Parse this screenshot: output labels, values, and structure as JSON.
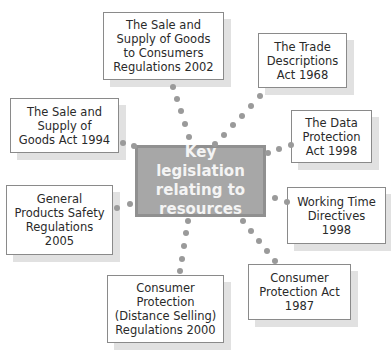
{
  "diagram": {
    "center": {
      "label": "Key legislation\nrelating to\nresources"
    },
    "nodes": [
      {
        "id": "sale-supply-consumers-2002",
        "label": "The Sale and\nSupply of Goods\nto Consumers\nRegulations 2002"
      },
      {
        "id": "trade-descriptions-1968",
        "label": "The Trade\nDescriptions\nAct 1968"
      },
      {
        "id": "data-protection-1998",
        "label": "The Data\nProtection\nAct 1998"
      },
      {
        "id": "working-time-1998",
        "label": "Working Time\nDirectives\n1998"
      },
      {
        "id": "consumer-protection-1987",
        "label": "Consumer\nProtection Act\n1987"
      },
      {
        "id": "distance-selling-2000",
        "label": "Consumer\nProtection\n(Distance Selling)\nRegulations 2000"
      },
      {
        "id": "general-products-safety-2005",
        "label": "General\nProducts Safety\nRegulations\n2005"
      },
      {
        "id": "sale-supply-1994",
        "label": "The Sale and\nSupply of\nGoods Act 1994"
      }
    ],
    "colors": {
      "center_fill": "#a7a7a7",
      "center_border": "#909090",
      "connector": "#9a9a9a",
      "shadow": "#e1e1e1"
    }
  }
}
